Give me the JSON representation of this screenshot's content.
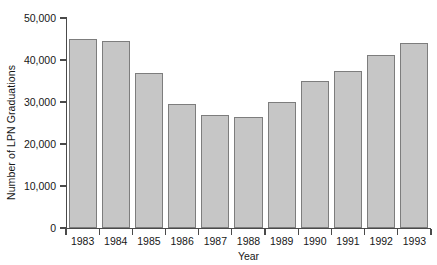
{
  "chart_data": {
    "type": "bar",
    "title": "",
    "xlabel": "Year",
    "ylabel": "Number of LPN Graduations",
    "categories": [
      "1983",
      "1984",
      "1985",
      "1986",
      "1987",
      "1988",
      "1989",
      "1990",
      "1991",
      "1992",
      "1993"
    ],
    "values": [
      45000,
      44500,
      36800,
      29500,
      27000,
      26500,
      30000,
      35000,
      37500,
      41200,
      44000
    ],
    "ylim": [
      0,
      50000
    ],
    "ytick_values": [
      0,
      10000,
      20000,
      30000,
      40000,
      50000
    ],
    "ytick_labels": [
      "0",
      "10,000",
      "20,000",
      "30,000",
      "40,000",
      "50,000"
    ],
    "grid": false,
    "legend": false,
    "bar_color": "#c6c6c6",
    "bar_border_color": "#7d7d7d",
    "axis_color": "#4a4a4a",
    "background_color": "#ffffff"
  }
}
